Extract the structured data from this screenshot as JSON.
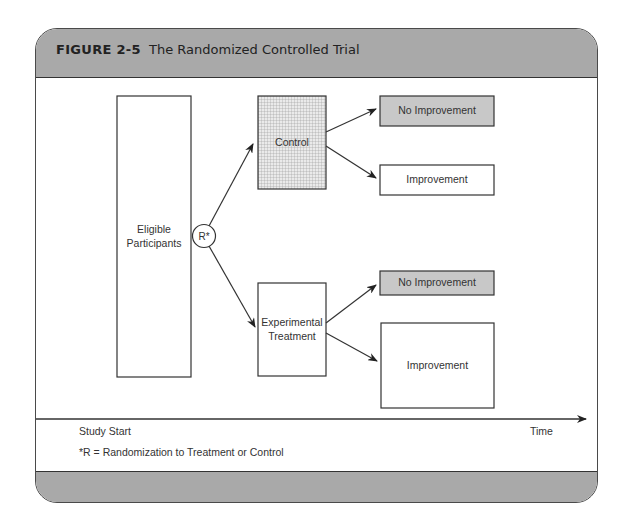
{
  "figure": {
    "number": "FIGURE 2-5",
    "title": "The Randomized Controlled Trial"
  },
  "nodes": {
    "eligible": "Eligible Participants",
    "randomization": "R*",
    "control": "Control",
    "experimental": "Experimental Treatment",
    "control_no_improvement": "No Improvement",
    "control_improvement": "Improvement",
    "treatment_no_improvement": "No Improvement",
    "treatment_improvement": "Improvement"
  },
  "timeline": {
    "start_label": "Study Start",
    "end_label": "Time"
  },
  "footnote": "*R = Randomization to Treatment or Control",
  "colors": {
    "header_fill": "#a9a9a9",
    "no_improvement_fill": "#c8c8c8",
    "control_fill": "#d9d9d9",
    "stroke": "#333333"
  }
}
